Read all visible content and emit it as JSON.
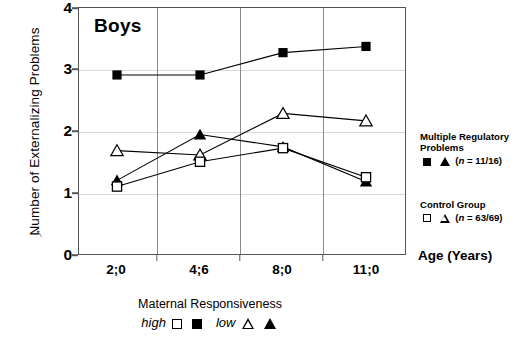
{
  "panel": {
    "title": "Boys"
  },
  "axes": {
    "ylabel": "Number of Externalizing Problems",
    "xlabel": "Age (Years)",
    "y_ticks": [
      "0",
      "1",
      "2",
      "3",
      "4"
    ],
    "x_ticks": [
      "2;0",
      "4;6",
      "8;0",
      "11;0"
    ],
    "arrow_glyph": "↑"
  },
  "legend": {
    "group1_title_line1": "Multiple Regulatory",
    "group1_title_line2": "Problems",
    "group1_n": "(n = 11/16)",
    "group1_n_italic": "n",
    "group1_n_rest": " = 11/16)",
    "group2_title": "Control Group",
    "group2_n": "(n = 63/69)",
    "group2_n_italic": "n",
    "group2_n_rest": " = 63/69)"
  },
  "caption": {
    "line1": "Maternal Responsiveness",
    "high_label": "high",
    "low_label": "low",
    "footnote": ""
  },
  "chart_data": {
    "type": "line",
    "title": "Boys",
    "xlabel": "Age (Years)",
    "ylabel": "Number of Externalizing Problems",
    "categories": [
      "2;0",
      "4;6",
      "8;0",
      "11;0"
    ],
    "ylim": [
      0,
      4
    ],
    "yticks": [
      0,
      1,
      2,
      3,
      4
    ],
    "grid": "both",
    "legend_position": "right",
    "series": [
      {
        "name": "Multiple Regulatory Problems – low maternal responsiveness",
        "marker": "filled-square",
        "group": "Multiple Regulatory Problems",
        "responsiveness": "low",
        "n": "11/16",
        "values": [
          2.92,
          2.92,
          3.28,
          3.38
        ]
      },
      {
        "name": "Multiple Regulatory Problems – high maternal responsiveness",
        "marker": "filled-triangle",
        "group": "Multiple Regulatory Problems",
        "responsiveness": "high",
        "n": "11/16",
        "values": [
          1.22,
          1.96,
          1.76,
          1.2
        ]
      },
      {
        "name": "Control Group – low maternal responsiveness",
        "marker": "open-triangle",
        "group": "Control Group",
        "responsiveness": "low",
        "n": "63/69",
        "values": [
          1.7,
          1.63,
          2.3,
          2.18
        ]
      },
      {
        "name": "Control Group – high maternal responsiveness",
        "marker": "open-square",
        "group": "Control Group",
        "responsiveness": "high",
        "n": "63/69",
        "values": [
          1.12,
          1.52,
          1.74,
          1.27
        ]
      }
    ]
  }
}
